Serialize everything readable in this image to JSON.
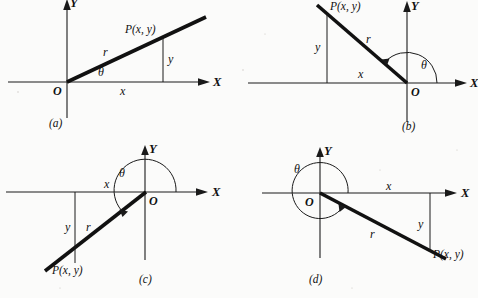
{
  "figure": {
    "background_color": "#fbfbfa",
    "ink_color": "#111111",
    "width": 478,
    "height": 298
  },
  "symbols": {
    "theta": "θ",
    "point_label": "P(x, y)",
    "radius_label": "r",
    "x_leg_label": "x",
    "y_leg_label": "y",
    "origin_label": "O",
    "x_axis_label": "X",
    "y_axis_label": "Y"
  },
  "panels": [
    {
      "id": "a",
      "caption": "(a)",
      "quadrant": "I",
      "x_axis_label": "X",
      "y_axis_label": "Y",
      "origin_label": "O",
      "point_label": "P(x, y)",
      "radius_label": "r",
      "x_leg_label": "x",
      "y_leg_label": "y",
      "angle_label": "θ",
      "angle_has_arc": false,
      "description": "Terminal ray in first quadrant; x positive, y positive",
      "origin_px": [
        67,
        82
      ],
      "point_px": [
        163,
        38
      ],
      "ray_end_px": [
        205,
        18
      ]
    },
    {
      "id": "b",
      "caption": "(b)",
      "quadrant": "II",
      "x_axis_label": "X",
      "y_axis_label": "Y",
      "origin_label": "O",
      "point_label": "P(x, y)",
      "radius_label": "r",
      "x_leg_label": "x",
      "y_leg_label": "y",
      "angle_label": "θ",
      "angle_has_arc": true,
      "description": "Terminal ray in second quadrant; x negative, y positive",
      "origin_px": [
        407,
        83
      ],
      "point_px": [
        327,
        12
      ],
      "ray_end_px": [
        317,
        4
      ]
    },
    {
      "id": "c",
      "caption": "(c)",
      "quadrant": "III",
      "x_axis_label": "X",
      "y_axis_label": "Y",
      "origin_label": "O",
      "point_label": "P(x, y)",
      "radius_label": "r",
      "x_leg_label": "x",
      "y_leg_label": "y",
      "angle_label": "θ",
      "angle_has_arc": true,
      "description": "Terminal ray in third quadrant; x negative, y negative",
      "origin_px": [
        145,
        192
      ],
      "point_px": [
        52,
        266
      ],
      "ray_end_px": [
        45,
        271
      ]
    },
    {
      "id": "d",
      "caption": "(d)",
      "quadrant": "IV",
      "x_axis_label": "X",
      "y_axis_label": "Y",
      "origin_label": "O",
      "point_label": "P(x, y)",
      "radius_label": "r",
      "x_leg_label": "x",
      "y_leg_label": "y",
      "angle_label": "θ",
      "angle_has_arc": true,
      "description": "Terminal ray in fourth quadrant; x positive, y negative",
      "origin_px": [
        320,
        193
      ],
      "point_px": [
        430,
        251
      ],
      "ray_end_px": [
        446,
        259
      ]
    }
  ]
}
